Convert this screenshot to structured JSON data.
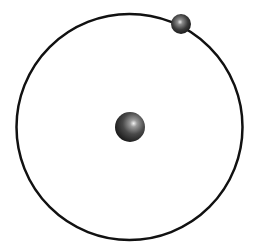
{
  "diagram": {
    "type": "atom-model",
    "background": "#ffffff",
    "orbit": {
      "cx": 129.5,
      "cy": 127,
      "r": 113,
      "stroke": "#111111",
      "stroke_width": 2.5
    },
    "nucleus": {
      "cx": 130,
      "cy": 127,
      "r": 15,
      "color": "#3a3a3a"
    },
    "electron": {
      "cx": 181,
      "cy": 24,
      "r": 10,
      "color": "#2e2e2e"
    }
  }
}
